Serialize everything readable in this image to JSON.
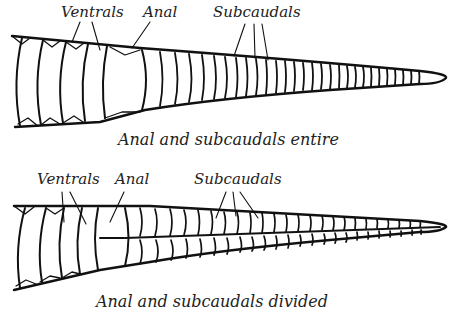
{
  "figures": [
    {
      "id": "entire",
      "labels": {
        "ventrals": "Ventrals",
        "anal": "Anal",
        "subcaudals": "Subcaudals"
      },
      "caption": "Anal and subcaudals entire"
    },
    {
      "id": "divided",
      "labels": {
        "ventrals": "Ventrals",
        "anal": "Anal",
        "subcaudals": "Subcaudals"
      },
      "caption": "Anal and subcaudals divided"
    }
  ],
  "colors": {
    "ink": "#111111",
    "background": "#ffffff"
  }
}
